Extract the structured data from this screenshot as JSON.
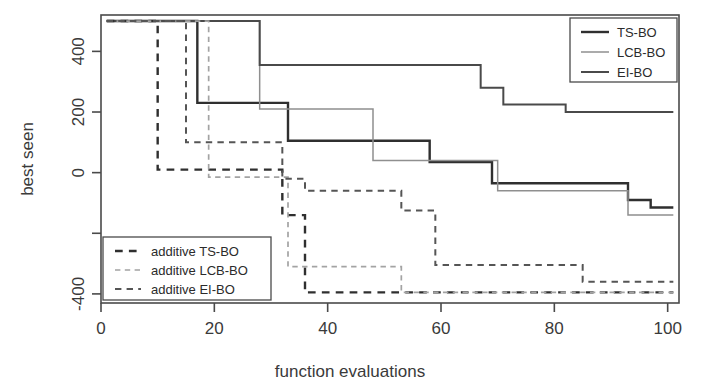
{
  "chart_data": {
    "type": "line",
    "subtype": "step",
    "title": "",
    "xlabel": "function evaluations",
    "ylabel": "best seen",
    "xlim": [
      0,
      102
    ],
    "ylim": [
      -430,
      520
    ],
    "xticks": [
      0,
      20,
      40,
      60,
      80,
      100
    ],
    "xtick_labels": [
      "0",
      "20",
      "40",
      "60",
      "80",
      "100"
    ],
    "yticks": [
      400,
      200,
      0,
      -200,
      -400
    ],
    "ytick_labels": [
      "400",
      "200",
      "0",
      "",
      "-400"
    ],
    "grid": false,
    "legend_position": "top-right and bottom-left",
    "series": [
      {
        "name": "TS-BO",
        "style": "solid",
        "color": "#2f2f2f",
        "width": 2.4,
        "x": [
          1,
          17,
          17,
          33,
          33,
          58,
          58,
          69,
          69,
          93,
          93,
          97,
          97,
          101
        ],
        "y": [
          500,
          500,
          230,
          230,
          105,
          105,
          35,
          35,
          -35,
          -35,
          -90,
          -90,
          -115,
          -115
        ]
      },
      {
        "name": "LCB-BO",
        "style": "solid",
        "color": "#8f8f8f",
        "width": 1.5,
        "x": [
          1,
          28,
          28,
          48,
          48,
          70,
          70,
          93,
          93,
          101
        ],
        "y": [
          500,
          500,
          210,
          210,
          40,
          40,
          -60,
          -60,
          -140,
          -140
        ]
      },
      {
        "name": "EI-BO",
        "style": "solid",
        "color": "#4a4a4a",
        "width": 2.0,
        "x": [
          1,
          28,
          28,
          67,
          67,
          71,
          71,
          82,
          82,
          101
        ],
        "y": [
          500,
          500,
          355,
          355,
          280,
          280,
          225,
          225,
          200,
          200
        ]
      },
      {
        "name": "additive TS-BO",
        "style": "dashed",
        "color": "#2f2f2f",
        "width": 2.4,
        "x": [
          1,
          10,
          10,
          32,
          32,
          36,
          36,
          101
        ],
        "y": [
          500,
          500,
          10,
          10,
          -140,
          -140,
          -395,
          -395
        ]
      },
      {
        "name": "additive LCB-BO",
        "style": "dashed",
        "color": "#a3a3a3",
        "width": 1.7,
        "x": [
          1,
          19,
          19,
          33,
          33,
          53,
          53,
          101
        ],
        "y": [
          500,
          500,
          -15,
          -15,
          -310,
          -310,
          -395,
          -395
        ]
      },
      {
        "name": "additive EI-BO",
        "style": "dashed",
        "color": "#555555",
        "width": 2.0,
        "x": [
          1,
          15,
          15,
          32,
          32,
          36,
          36,
          53,
          53,
          59,
          59,
          85,
          85,
          101
        ],
        "y": [
          500,
          500,
          100,
          100,
          -20,
          -20,
          -60,
          -60,
          -125,
          -125,
          -305,
          -305,
          -360,
          -360
        ]
      }
    ]
  },
  "legend_top": {
    "items": [
      {
        "label": "TS-BO",
        "series": "TS-BO"
      },
      {
        "label": "LCB-BO",
        "series": "LCB-BO"
      },
      {
        "label": "EI-BO",
        "series": "EI-BO"
      }
    ]
  },
  "legend_bottom": {
    "items": [
      {
        "label": "additive TS-BO",
        "series": "additive TS-BO"
      },
      {
        "label": "additive LCB-BO",
        "series": "additive LCB-BO"
      },
      {
        "label": "additive EI-BO",
        "series": "additive EI-BO"
      }
    ]
  },
  "colors": {
    "background": "#ffffff",
    "axis": "#4a4a4a",
    "text": "#3a3a3a"
  }
}
